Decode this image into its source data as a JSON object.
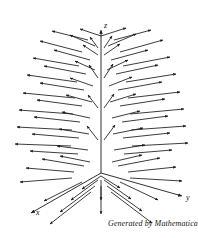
{
  "figure": {
    "kind": "3d-vector-field-plot",
    "generator_caption": "Generated by Mathematica",
    "background_color": "#ffffff",
    "stroke_color": "#1a1a1a",
    "axes": {
      "z": {
        "label": "z",
        "arrow": true
      },
      "y": {
        "label": "y",
        "arrow": true
      },
      "x": {
        "label": "x",
        "arrow": true
      }
    }
  },
  "chart_data": {
    "type": "scatter",
    "title": "",
    "xlabel": "x",
    "ylabel": "y",
    "zlabel": "z",
    "grid": false,
    "legend": null,
    "projection": "3d-orthographic",
    "origin_px": [
      101,
      173
    ],
    "axis_endpoints_px": {
      "z_tip": [
        101,
        30
      ],
      "y_tip": [
        182,
        196
      ],
      "x_tip": [
        31,
        213
      ]
    },
    "vectors_px": [
      [
        101,
        36,
        126,
        28
      ],
      [
        101,
        36,
        80,
        29
      ],
      [
        108,
        46,
        136,
        34
      ],
      [
        95,
        46,
        70,
        35
      ],
      [
        114,
        40,
        151,
        30
      ],
      [
        88,
        40,
        52,
        31
      ],
      [
        120,
        52,
        163,
        40
      ],
      [
        82,
        52,
        40,
        41
      ],
      [
        111,
        60,
        148,
        50
      ],
      [
        90,
        60,
        54,
        50
      ],
      [
        104,
        55,
        120,
        44
      ],
      [
        98,
        55,
        83,
        45
      ],
      [
        123,
        66,
        170,
        57
      ],
      [
        79,
        66,
        33,
        58
      ],
      [
        116,
        74,
        158,
        65
      ],
      [
        86,
        74,
        44,
        66
      ],
      [
        107,
        70,
        128,
        60
      ],
      [
        95,
        70,
        75,
        61
      ],
      [
        126,
        82,
        176,
        74
      ],
      [
        77,
        82,
        27,
        75
      ],
      [
        118,
        90,
        162,
        82
      ],
      [
        84,
        90,
        40,
        83
      ],
      [
        109,
        86,
        132,
        77
      ],
      [
        93,
        86,
        70,
        78
      ],
      [
        128,
        98,
        180,
        92
      ],
      [
        75,
        98,
        23,
        93
      ],
      [
        120,
        106,
        165,
        99
      ],
      [
        82,
        106,
        37,
        100
      ],
      [
        110,
        102,
        136,
        94
      ],
      [
        92,
        102,
        66,
        95
      ],
      [
        130,
        114,
        184,
        109
      ],
      [
        73,
        114,
        19,
        110
      ],
      [
        122,
        122,
        168,
        116
      ],
      [
        80,
        122,
        34,
        117
      ],
      [
        112,
        118,
        140,
        111
      ],
      [
        90,
        118,
        62,
        112
      ],
      [
        131,
        130,
        186,
        126
      ],
      [
        72,
        130,
        17,
        127
      ],
      [
        123,
        138,
        170,
        133
      ],
      [
        79,
        138,
        32,
        134
      ],
      [
        113,
        134,
        143,
        128
      ],
      [
        89,
        134,
        59,
        129
      ],
      [
        132,
        146,
        188,
        143
      ],
      [
        71,
        146,
        15,
        144
      ],
      [
        124,
        154,
        172,
        150
      ],
      [
        78,
        154,
        30,
        151
      ],
      [
        114,
        150,
        145,
        145
      ],
      [
        88,
        150,
        57,
        146
      ],
      [
        104,
        48,
        112,
        36
      ],
      [
        98,
        48,
        90,
        37
      ],
      [
        104,
        78,
        113,
        64
      ],
      [
        98,
        78,
        89,
        65
      ],
      [
        104,
        108,
        114,
        94
      ],
      [
        98,
        108,
        88,
        95
      ],
      [
        104,
        140,
        115,
        125
      ],
      [
        98,
        140,
        87,
        126
      ],
      [
        101,
        176,
        120,
        188
      ],
      [
        101,
        176,
        82,
        189
      ],
      [
        104,
        180,
        131,
        199
      ],
      [
        98,
        180,
        71,
        200
      ],
      [
        107,
        186,
        142,
        211
      ],
      [
        95,
        186,
        60,
        212
      ],
      [
        111,
        192,
        152,
        223
      ],
      [
        91,
        192,
        50,
        224
      ],
      [
        101,
        180,
        101,
        200
      ],
      [
        101,
        186,
        101,
        214
      ],
      [
        118,
        166,
        160,
        158
      ],
      [
        84,
        166,
        42,
        159
      ],
      [
        128,
        172,
        176,
        167
      ],
      [
        74,
        172,
        26,
        168
      ],
      [
        112,
        162,
        142,
        155
      ],
      [
        90,
        162,
        60,
        156
      ],
      [
        120,
        182,
        158,
        200
      ],
      [
        82,
        182,
        44,
        201
      ],
      [
        130,
        178,
        182,
        181
      ],
      [
        72,
        178,
        20,
        182
      ]
    ]
  }
}
